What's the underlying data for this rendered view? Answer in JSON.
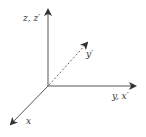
{
  "diagram": {
    "colors": {
      "axis": "#555555",
      "dashed": "#666666",
      "label": "#333333"
    },
    "origin": {
      "x": 48,
      "y": 86
    },
    "axes": [
      {
        "id": "z",
        "label": "z, z′",
        "style": "solid",
        "end": {
          "x": 48,
          "y": 8
        }
      },
      {
        "id": "y",
        "label": "y, x′",
        "style": "solid",
        "end": {
          "x": 137,
          "y": 86
        }
      },
      {
        "id": "x",
        "label": "x",
        "style": "solid",
        "end": {
          "x": 10,
          "y": 125
        }
      },
      {
        "id": "yprime",
        "label": "y′",
        "style": "dashed",
        "end": {
          "x": 88,
          "y": 42
        }
      }
    ]
  }
}
